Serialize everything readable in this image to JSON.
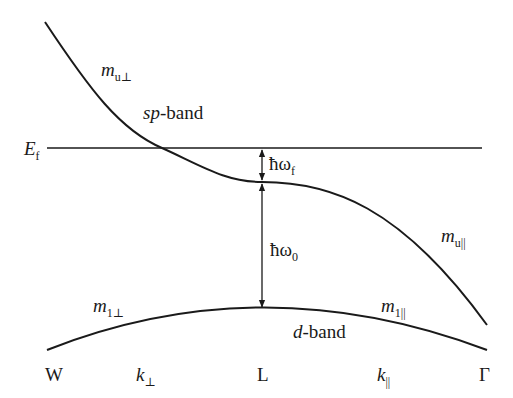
{
  "diagram": {
    "type": "band-structure",
    "lines": {
      "fermi_level": {
        "x1": 47,
        "y": 148,
        "x2": 482
      },
      "sp_band_path": "M 45 22 C 90 90, 120 130, 162 148 C 200 165, 225 182, 262 182 C 330 182, 400 205, 487 325",
      "d_band_path": "M 47 350 Q 262 265 487 350",
      "arrow_x": 262,
      "arrow_f": {
        "y1": 148,
        "y2": 182
      },
      "arrow_0": {
        "y1": 182,
        "y2": 308
      }
    },
    "colors": {
      "stroke": "#1a1a1a",
      "background": "#ffffff"
    },
    "labels": {
      "m_u_perp": {
        "base": "m",
        "sub": "u⊥"
      },
      "sp_band": {
        "italic": "sp",
        "rest": "-band"
      },
      "e_f": {
        "base": "E",
        "sub": "f"
      },
      "hw_f": {
        "base": "ħω",
        "sub": "f"
      },
      "hw_0": {
        "base": "ħω",
        "sub": "0"
      },
      "m_u_par": {
        "base": "m",
        "sub": "u||"
      },
      "m_1_perp": {
        "base": "m",
        "sub": "1⊥"
      },
      "m_1_par": {
        "base": "m",
        "sub": "1||"
      },
      "d_band": {
        "italic": "d",
        "rest": "-band"
      }
    },
    "axis_ticks": {
      "w": "W",
      "k_perp": {
        "base": "k",
        "sub": "⊥"
      },
      "l": "L",
      "k_par": {
        "base": "k",
        "sub": "||"
      },
      "gamma": "Γ"
    }
  }
}
